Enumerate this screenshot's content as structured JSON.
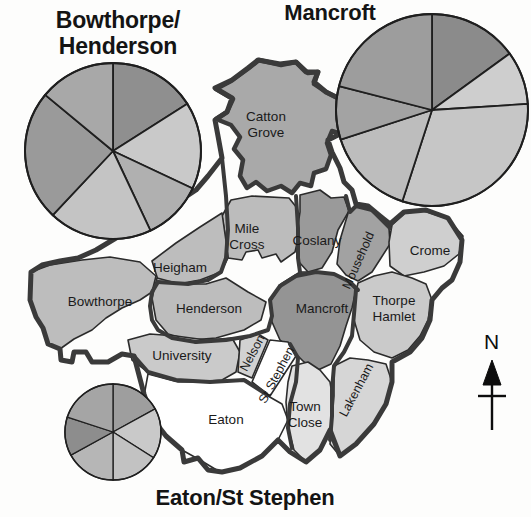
{
  "figure": {
    "type": "map-with-pie-insets",
    "background_color": "#fdfdfc",
    "outline_color": "#3a3a3a"
  },
  "charts": [
    {
      "id": "bowthorpe-henderson",
      "title": "Bowthorpe/\nHenderson",
      "title_position": "top-left",
      "center": {
        "x": 113,
        "y": 151
      },
      "radius": 88,
      "chart_data": {
        "type": "pie",
        "title": "Bowthorpe/Henderson",
        "categories": [
          "Segment 1",
          "Segment 2",
          "Segment 3",
          "Segment 4",
          "Segment 5",
          "Segment 6"
        ],
        "values": [
          16,
          16,
          11,
          19,
          24,
          14
        ],
        "start_angle_deg": 0,
        "direction": "clockwise",
        "colors": [
          "#8f8f8f",
          "#c9c9c9",
          "#b0b0b0",
          "#c4c4c4",
          "#9a9a9a",
          "#a8a8a8"
        ],
        "legend": "none",
        "grid": false
      }
    },
    {
      "id": "mancroft",
      "title": "Mancroft",
      "title_position": "top-right",
      "center": {
        "x": 432,
        "y": 110
      },
      "radius": 96,
      "chart_data": {
        "type": "pie",
        "title": "Mancroft",
        "categories": [
          "Segment 1",
          "Segment 2",
          "Segment 3",
          "Segment 4",
          "Segment 5",
          "Segment 6"
        ],
        "values": [
          15,
          9,
          31,
          15,
          9,
          21
        ],
        "start_angle_deg": 0,
        "direction": "clockwise",
        "colors": [
          "#8b8b8b",
          "#cecece",
          "#c6c6c6",
          "#bdbdbd",
          "#a3a3a3",
          "#9d9d9d"
        ],
        "legend": "none",
        "grid": false
      }
    },
    {
      "id": "eaton-st-stephen",
      "title": "Eaton/St Stephen",
      "title_position": "bottom-left",
      "center": {
        "x": 113,
        "y": 432
      },
      "radius": 48,
      "chart_data": {
        "type": "pie",
        "title": "Eaton/St Stephen",
        "categories": [
          "Segment 1",
          "Segment 2",
          "Segment 3",
          "Segment 4",
          "Segment 5",
          "Segment 6"
        ],
        "values": [
          17,
          17,
          16,
          17,
          13,
          20
        ],
        "start_angle_deg": 0,
        "direction": "clockwise",
        "colors": [
          "#9e9e9e",
          "#c9c9c9",
          "#c2c2c2",
          "#b6b6b6",
          "#8d8d8d",
          "#a5a5a5"
        ],
        "legend": "none",
        "grid": false
      }
    }
  ],
  "map": {
    "name": "Norwich wards map",
    "regions": [
      {
        "id": "catton-grove",
        "label": "Catton\nGrove",
        "label_x": 266,
        "label_y": 126,
        "fill": "#a9a9a9"
      },
      {
        "id": "mile-cross",
        "label": "Mile\nCross",
        "label_x": 243,
        "label_y": 236,
        "fill": "#bcbcbc"
      },
      {
        "id": "coslany",
        "label": "Coslany",
        "label_x": 311,
        "label_y": 243,
        "fill": "#9a9a9a"
      },
      {
        "id": "mousehold",
        "label": "Mousehold",
        "label_x": 362,
        "label_y": 262,
        "fill": "#a2a2a2",
        "rotation": -66
      },
      {
        "id": "crome",
        "label": "Crome",
        "label_x": 428,
        "label_y": 256,
        "fill": "#cfcfcf"
      },
      {
        "id": "heigham",
        "label": "Heigham",
        "label_x": 178,
        "label_y": 269,
        "fill": "#bdbdbd"
      },
      {
        "id": "bowthorpe",
        "label": "Bowthorpe",
        "label_x": 100,
        "label_y": 305,
        "fill": "#bdbdbd"
      },
      {
        "id": "henderson",
        "label": "Henderson",
        "label_x": 209,
        "label_y": 311,
        "fill": "#bdbdbd"
      },
      {
        "id": "mancroft",
        "label": "Mancroft",
        "label_x": 322,
        "label_y": 310,
        "fill": "#949494"
      },
      {
        "id": "thorpe-hamlet",
        "label": "Thorpe\nHamlet",
        "label_x": 393,
        "label_y": 305,
        "fill": "#cacaca"
      },
      {
        "id": "university",
        "label": "University",
        "label_x": 182,
        "label_y": 356,
        "fill": "#cacaca"
      },
      {
        "id": "nelson",
        "label": "Nelson",
        "label_x": 256,
        "label_y": 355,
        "fill": "#d2d2d2",
        "rotation": -62
      },
      {
        "id": "st-stephen",
        "label": "St Stephen",
        "label_x": 282,
        "label_y": 375,
        "fill": "#ffffff",
        "rotation": -62
      },
      {
        "id": "eaton",
        "label": "Eaton",
        "label_x": 225,
        "label_y": 420,
        "fill": "#ffffff"
      },
      {
        "id": "town-close",
        "label": "Town\nClose",
        "label_x": 303,
        "label_y": 411,
        "fill": "#e2e2e2"
      },
      {
        "id": "lakenham",
        "label": "Lakenham",
        "label_x": 357,
        "label_y": 388,
        "fill": "#d6d6d6",
        "rotation": -62
      }
    ]
  },
  "compass": {
    "label": "N",
    "x": 492,
    "y": 345
  }
}
